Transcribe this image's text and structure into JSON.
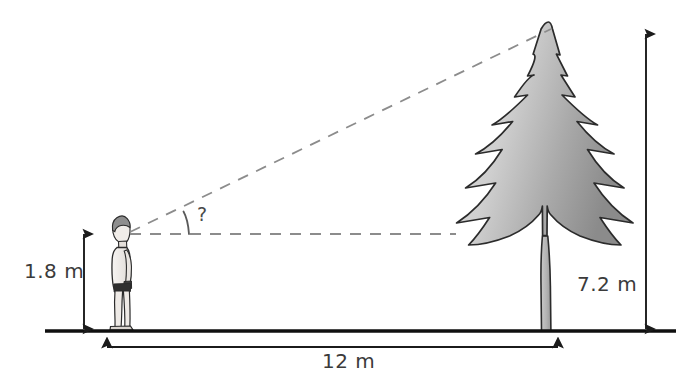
{
  "diagram": {
    "ground_line": "ground-line",
    "labels": {
      "person_height": "1.8 m",
      "tree_height": "7.2 m",
      "horizontal_distance": "12 m",
      "unknown_angle": "?"
    },
    "figures": {
      "person": "person-figure",
      "tree": "fir-tree-figure"
    },
    "lines": {
      "sight_line": "dashed-sight-line",
      "horizontal_eye_line": "dashed-horizontal-eye-line"
    },
    "arrows": {
      "person_height_arrow": "vertical-double-arrow-left",
      "tree_height_arrow": "vertical-double-arrow-right",
      "distance_arrow": "horizontal-double-arrow"
    },
    "colors": {
      "ink": "#1b1b1b",
      "text": "#3b3b3b",
      "dashed": "#8c8c8c",
      "tree_light": "#d2d2d2",
      "tree_dark": "#8e8e8e",
      "person_skin": "#efece8",
      "person_hair": "#9a9a9a"
    },
    "geometry": {
      "eye_point": [
        122,
        234
      ],
      "treetop_point": [
        553,
        30
      ],
      "ground_y": 331,
      "person_x": 118,
      "tree_base_x": 546,
      "distance_arrow_y": 347,
      "person_arrow_x": 84,
      "tree_arrow_x": 646
    }
  }
}
